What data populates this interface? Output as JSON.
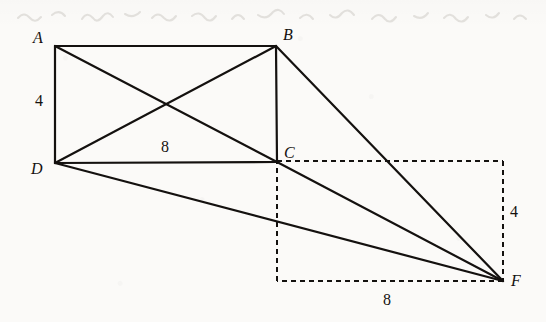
{
  "figure": {
    "kind": "geometry-diagram",
    "background_color": "#fbfaf8",
    "stroke_color": "#14110f",
    "canvas": {
      "width": 546,
      "height": 322
    },
    "vertices": [
      {
        "id": "A",
        "label": "A",
        "x": 55,
        "y": 46,
        "label_x": 33,
        "label_y": 30
      },
      {
        "id": "B",
        "label": "B",
        "x": 276,
        "y": 46,
        "label_x": 283,
        "label_y": 27
      },
      {
        "id": "C",
        "label": "C",
        "x": 277,
        "y": 162,
        "label_x": 284,
        "label_y": 145
      },
      {
        "id": "D",
        "label": "D",
        "x": 55,
        "y": 163,
        "label_x": 31,
        "label_y": 161
      },
      {
        "id": "F",
        "label": "F",
        "x": 503,
        "y": 281,
        "label_x": 511,
        "label_y": 273
      }
    ],
    "solid_edges": [
      {
        "name": "edge-AB",
        "from": "A",
        "to": "B"
      },
      {
        "name": "edge-BC",
        "from": "B",
        "to": "C"
      },
      {
        "name": "edge-CD",
        "from": "C",
        "to": "D"
      },
      {
        "name": "edge-DA",
        "from": "D",
        "to": "A"
      },
      {
        "name": "diagonal-AC",
        "from": "A",
        "to": "C"
      },
      {
        "name": "diagonal-BD",
        "from": "B",
        "to": "D"
      },
      {
        "name": "edge-BF",
        "from": "B",
        "to": "F"
      },
      {
        "name": "edge-CF",
        "from": "C",
        "to": "F"
      },
      {
        "name": "edge-DF",
        "from": "D",
        "to": "F"
      }
    ],
    "dashed_rectangle": {
      "name": "dashed-rect-CF",
      "left": 277,
      "top": 161,
      "right": 503,
      "bottom": 281,
      "dash": "5 4"
    },
    "dimension_labels": [
      {
        "name": "dimension-AD",
        "text": "4",
        "x": 35,
        "y": 93,
        "measures": "AD"
      },
      {
        "name": "dimension-DC",
        "text": "8",
        "x": 161,
        "y": 139,
        "measures": "DC"
      },
      {
        "name": "dimension-right-side",
        "text": "4",
        "x": 510,
        "y": 204,
        "measures": "right vertical side of dashed rectangle"
      },
      {
        "name": "dimension-bottom",
        "text": "8",
        "x": 383,
        "y": 292,
        "measures": "bottom side of dashed rectangle"
      }
    ]
  }
}
